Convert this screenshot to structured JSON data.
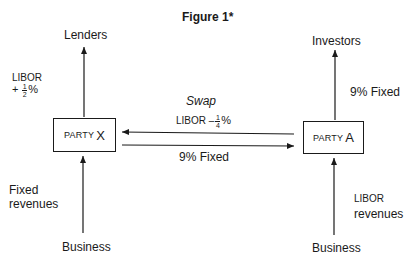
{
  "figure": {
    "title": "Figure 1*"
  },
  "party_x": {
    "label_prefix": "PARTY",
    "label_letter": "X",
    "top_node": "Lenders",
    "top_flow": {
      "line1": "LIBOR",
      "sign": "+",
      "num": "1",
      "den": "2",
      "suffix": "%"
    },
    "bottom_node": "Business",
    "bottom_flow": {
      "line1": "Fixed",
      "line2": "revenues"
    }
  },
  "party_a": {
    "label_prefix": "PARTY",
    "label_letter": "A",
    "top_node": "Investors",
    "top_flow": "9% Fixed",
    "bottom_node": "Business",
    "bottom_flow": {
      "line1": "LIBOR",
      "line2": "revenues"
    }
  },
  "swap": {
    "title": "Swap",
    "a_to_x": {
      "prefix": "LIBOR",
      "sign": "–",
      "num": "1",
      "den": "4",
      "suffix": "%"
    },
    "x_to_a": "9% Fixed"
  },
  "colors": {
    "ink": "#1a1a1a",
    "background": "#ffffff"
  }
}
